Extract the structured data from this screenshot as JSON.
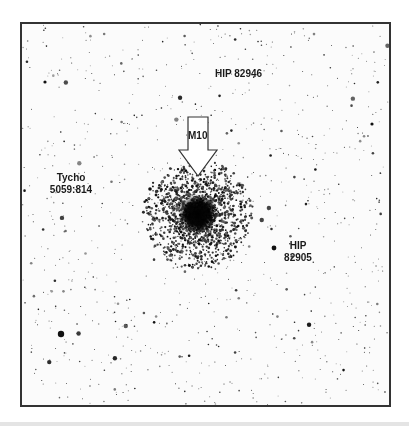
{
  "image": {
    "subject": "star field with globular cluster",
    "frame_color": "#333333",
    "background_color": "#fbfbfb"
  },
  "labels": {
    "hip_82946": "HIP 82946",
    "m10": "M10",
    "tycho_line1": "Tycho",
    "tycho_line2": "5059:814",
    "hip_82905_line1": "HIP",
    "hip_82905_line2": "82905"
  },
  "cluster": {
    "name": "M10",
    "center_x": 176,
    "center_y": 190,
    "core_radius": 20,
    "halo_radius": 55
  },
  "arrow": {
    "points_to": "M10",
    "color": "#ffffff",
    "outline": "#333333"
  }
}
